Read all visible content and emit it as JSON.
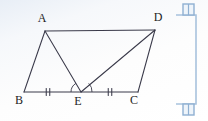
{
  "canvas": {
    "width": 208,
    "height": 121
  },
  "figure": {
    "name": "quadrilateral-abcd-with-midpoint-e",
    "stroke_color": "#3a3a4a",
    "label_color": "#1d1d24",
    "vertices": [
      {
        "id": "A",
        "label": "A",
        "x": 45,
        "y": 31,
        "label_x": 42,
        "label_y": 22
      },
      {
        "id": "D",
        "label": "D",
        "x": 155,
        "y": 30,
        "label_x": 158,
        "label_y": 21
      },
      {
        "id": "B",
        "label": "B",
        "x": 24,
        "y": 92,
        "label_x": 19,
        "label_y": 104
      },
      {
        "id": "E",
        "label": "E",
        "x": 81,
        "y": 92,
        "label_x": 78,
        "label_y": 105
      },
      {
        "id": "C",
        "label": "C",
        "x": 138,
        "y": 92,
        "label_x": 134,
        "label_y": 104
      }
    ],
    "segments": [
      {
        "name": "segment-ad",
        "from": "A",
        "to": "D"
      },
      {
        "name": "segment-ab",
        "from": "A",
        "to": "B"
      },
      {
        "name": "segment-ae",
        "from": "A",
        "to": "E"
      },
      {
        "name": "segment-bc",
        "from": "B",
        "to": "C"
      },
      {
        "name": "segment-ed",
        "from": "E",
        "to": "D"
      },
      {
        "name": "segment-dc",
        "from": "D",
        "to": "C"
      }
    ],
    "tick_marks": [
      {
        "name": "tick-mark-be",
        "on_segment": "BE",
        "count": 2,
        "x": 48,
        "y": 92
      },
      {
        "name": "tick-mark-ec",
        "on_segment": "EC",
        "count": 2,
        "x": 110,
        "y": 92
      }
    ],
    "angle_arcs": [
      {
        "name": "angle-arc-aeb",
        "at_vertex": "E",
        "side": "left"
      },
      {
        "name": "angle-arc-dec",
        "at_vertex": "E",
        "side": "right"
      }
    ]
  },
  "selection": {
    "name": "crop-selection-overlay",
    "color": "#a8c2dd",
    "accent": "#8fb0d2",
    "handles": [
      {
        "name": "selection-handle-top-right",
        "x": 188,
        "y": 8
      },
      {
        "name": "selection-handle-bottom-right",
        "x": 188,
        "y": 111
      }
    ],
    "guides": [
      {
        "name": "selection-guide-top",
        "x1": 178,
        "y1": 15,
        "x2": 196,
        "y2": 15
      },
      {
        "name": "selection-guide-right",
        "x1": 196,
        "y1": 15,
        "x2": 196,
        "y2": 104
      },
      {
        "name": "selection-guide-bottom",
        "x1": 178,
        "y1": 104,
        "x2": 196,
        "y2": 104
      }
    ]
  }
}
